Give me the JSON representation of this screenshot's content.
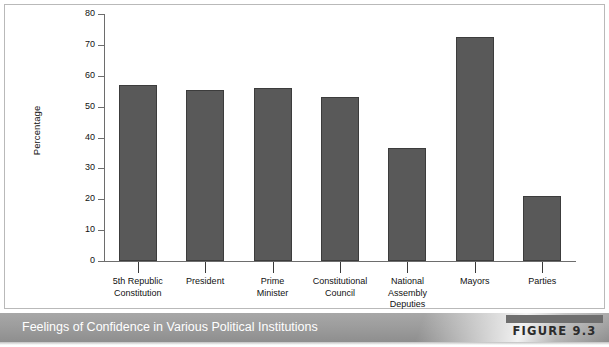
{
  "figure": {
    "caption": "Feelings of Confidence in Various Political Institutions",
    "tag": "FIGURE 9.3"
  },
  "chart_data": {
    "type": "bar",
    "title": "Feelings of Confidence in Various Political Institutions",
    "xlabel": "",
    "ylabel": "Percentage",
    "ylim": [
      0,
      80
    ],
    "yticks": [
      0,
      10,
      20,
      30,
      40,
      50,
      60,
      70,
      80
    ],
    "ytick_labels": [
      "0",
      "10",
      "20",
      "30",
      "40",
      "50",
      "60",
      "70",
      "80"
    ],
    "grid": false,
    "legend": null,
    "bar_color": "#595959",
    "bar_edge_color": "#3c3c3c",
    "categories": [
      "5th Republic Constitution",
      "President",
      "Prime Minister",
      "Constitutional Council",
      "National Assembly Deputies",
      "Mayors",
      "Parties"
    ],
    "category_lines": [
      [
        "5th Republic",
        "Constitution"
      ],
      [
        "President"
      ],
      [
        "Prime",
        "Minister"
      ],
      [
        "Constitutional",
        "Council"
      ],
      [
        "National",
        "Assembly",
        "Deputies"
      ],
      [
        "Mayors"
      ],
      [
        "Parties"
      ]
    ],
    "values": [
      57,
      55.5,
      56,
      53,
      36.5,
      72.5,
      21
    ]
  }
}
